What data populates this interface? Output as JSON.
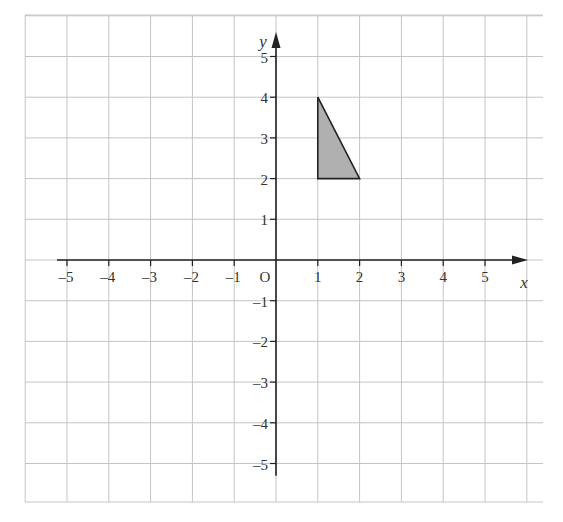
{
  "diagram": {
    "type": "coordinate-grid",
    "x_axis": {
      "label": "x",
      "ticks": [
        "-5",
        "-4",
        "-3",
        "-2",
        "-1",
        "1",
        "2",
        "3",
        "4",
        "5"
      ]
    },
    "y_axis": {
      "label": "y",
      "ticks": [
        "5",
        "4",
        "3",
        "2",
        "1",
        "-1",
        "-2",
        "-3",
        "-4",
        "-5"
      ]
    },
    "origin_label": "O",
    "shape": {
      "name": "triangle",
      "vertices": [
        [
          1,
          4
        ],
        [
          1,
          2
        ],
        [
          2,
          2
        ]
      ],
      "fill": "#b0b0b0",
      "stroke": "#222222"
    },
    "colors": {
      "grid": "#c4c4c4",
      "axes": "#222222"
    }
  }
}
